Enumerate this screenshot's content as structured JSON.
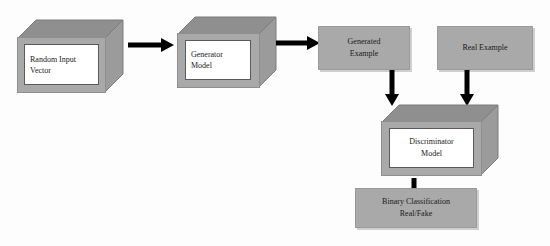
{
  "diagram": {
    "background_color": "#fdfdfd",
    "node_fill_color": "#a9a9a9",
    "node_top_color": "#8f8f8f",
    "node_side_color": "#9b9b9b",
    "panel_fill_color": "#ffffff",
    "arrow_color": "#000000",
    "text_color": "#1a1a1a"
  },
  "nodes": {
    "random_input_vector": {
      "id": "random-input-vector",
      "shape": "3d-cube",
      "lines": [
        "Random Input",
        "Vector"
      ],
      "align": "left"
    },
    "generator_model": {
      "id": "generator-model",
      "shape": "3d-cube",
      "lines": [
        "Generator",
        "Model"
      ],
      "align": "left"
    },
    "generated_example": {
      "id": "generated-example",
      "shape": "flat-box",
      "lines": [
        "Generated",
        "Example"
      ],
      "align": "center"
    },
    "real_example": {
      "id": "real-example",
      "shape": "flat-box",
      "lines": [
        "Real Example"
      ],
      "align": "center"
    },
    "discriminator_model": {
      "id": "discriminator-model",
      "shape": "3d-cube",
      "lines": [
        "Discriminator",
        "Model"
      ],
      "align": "center"
    },
    "binary_classification": {
      "id": "binary-classification",
      "shape": "flat-box",
      "lines": [
        "Binary Classification",
        "Real/Fake"
      ],
      "align": "center"
    }
  },
  "edges": [
    {
      "id": "edge-input-to-generator",
      "from": "random_input_vector",
      "to": "generator_model",
      "direction": "right"
    },
    {
      "id": "edge-generator-to-generated",
      "from": "generator_model",
      "to": "generated_example",
      "direction": "right"
    },
    {
      "id": "edge-generated-to-discriminator",
      "from": "generated_example",
      "to": "discriminator_model",
      "direction": "down"
    },
    {
      "id": "edge-real-to-discriminator",
      "from": "real_example",
      "to": "discriminator_model",
      "direction": "down"
    },
    {
      "id": "edge-discriminator-to-output",
      "from": "discriminator_model",
      "to": "binary_classification",
      "direction": "down"
    }
  ]
}
